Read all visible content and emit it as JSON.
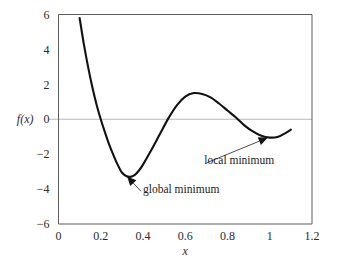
{
  "chart_data": {
    "type": "line",
    "title": "",
    "xlabel": "x",
    "ylabel": "f(x)",
    "xlim": [
      0,
      1.2
    ],
    "ylim": [
      -6,
      6
    ],
    "x_ticks": [
      "0",
      "0.2",
      "0.4",
      "0.6",
      "0.8",
      "1",
      "1.2"
    ],
    "x_tick_values": [
      0,
      0.2,
      0.4,
      0.6,
      0.8,
      1.0,
      1.2
    ],
    "y_ticks": [
      "6",
      "4",
      "2",
      "0",
      "−2",
      "−4",
      "−6"
    ],
    "y_tick_values": [
      6,
      4,
      2,
      0,
      -2,
      -4,
      -6
    ],
    "grid": false,
    "zero_line": true,
    "legend": null,
    "series": [
      {
        "name": "f(x)",
        "color": "#121212",
        "x": [
          0.1,
          0.12,
          0.14,
          0.16,
          0.18,
          0.2,
          0.22,
          0.24,
          0.26,
          0.28,
          0.3,
          0.32,
          0.34,
          0.36,
          0.38,
          0.4,
          0.44,
          0.48,
          0.52,
          0.56,
          0.6,
          0.64,
          0.68,
          0.72,
          0.76,
          0.8,
          0.84,
          0.88,
          0.92,
          0.96,
          1.0,
          1.04,
          1.08,
          1.1
        ],
        "y": [
          5.8,
          4.3,
          3.0,
          1.85,
          0.85,
          0.0,
          -0.75,
          -1.45,
          -2.05,
          -2.6,
          -3.05,
          -3.25,
          -3.3,
          -3.2,
          -2.95,
          -2.6,
          -1.75,
          -0.85,
          0.05,
          0.8,
          1.3,
          1.5,
          1.45,
          1.25,
          0.9,
          0.5,
          0.1,
          -0.35,
          -0.7,
          -0.95,
          -1.05,
          -1.0,
          -0.75,
          -0.6
        ]
      }
    ],
    "annotations": [
      {
        "label": "global minimum",
        "point_x": 0.325,
        "point_y": -3.28,
        "text_x": 0.4,
        "text_y": -4.25
      },
      {
        "label": "local minimum",
        "point_x": 0.99,
        "point_y": -1.06,
        "text_x": 0.69,
        "text_y": -2.55
      }
    ],
    "colors": {
      "curve": "#121212",
      "frame": "#5c5c5c",
      "zero_line": "#b9b9b9",
      "text": "#1a1a1a",
      "background": "#ffffff"
    }
  }
}
